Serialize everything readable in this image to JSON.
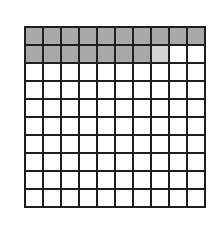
{
  "diagram": {
    "type": "hundred-grid",
    "rows": 10,
    "columns": 10,
    "shaded_cells": 17,
    "partially_shaded_cells": 1,
    "unshaded_cells": 82,
    "row_states": [
      [
        "s",
        "s",
        "s",
        "s",
        "s",
        "s",
        "s",
        "s",
        "s",
        "s"
      ],
      [
        "s",
        "s",
        "s",
        "s",
        "s",
        "s",
        "s",
        "p",
        "u",
        "u"
      ],
      [
        "u",
        "u",
        "u",
        "u",
        "u",
        "u",
        "u",
        "u",
        "u",
        "u"
      ],
      [
        "u",
        "u",
        "u",
        "u",
        "u",
        "u",
        "u",
        "u",
        "u",
        "u"
      ],
      [
        "u",
        "u",
        "u",
        "u",
        "u",
        "u",
        "u",
        "u",
        "u",
        "u"
      ],
      [
        "u",
        "u",
        "u",
        "u",
        "u",
        "u",
        "u",
        "u",
        "u",
        "u"
      ],
      [
        "u",
        "u",
        "u",
        "u",
        "u",
        "u",
        "u",
        "u",
        "u",
        "u"
      ],
      [
        "u",
        "u",
        "u",
        "u",
        "u",
        "u",
        "u",
        "u",
        "u",
        "u"
      ],
      [
        "u",
        "u",
        "u",
        "u",
        "u",
        "u",
        "u",
        "u",
        "u",
        "u"
      ],
      [
        "u",
        "u",
        "u",
        "u",
        "u",
        "u",
        "u",
        "u",
        "u",
        "u"
      ]
    ],
    "colors": {
      "shaded": "#a8a8a8",
      "partial": "#d2d2d2",
      "unshaded": "#ffffff",
      "gridline": "#1e1e1e"
    }
  }
}
